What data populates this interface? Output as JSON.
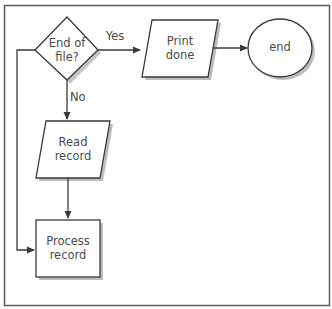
{
  "diagram": {
    "type": "flowchart",
    "nodes": [
      {
        "id": "decision",
        "shape": "diamond",
        "label": "End of\nfile?"
      },
      {
        "id": "print",
        "shape": "parallelogram",
        "label": "Print\ndone"
      },
      {
        "id": "end",
        "shape": "ellipse",
        "label": "end"
      },
      {
        "id": "read",
        "shape": "parallelogram",
        "label": "Read\nrecord"
      },
      {
        "id": "process",
        "shape": "rectangle",
        "label": "Process\nrecord"
      }
    ],
    "edges": [
      {
        "from": "decision",
        "to": "print",
        "label": "Yes"
      },
      {
        "from": "print",
        "to": "end",
        "label": ""
      },
      {
        "from": "decision",
        "to": "read",
        "label": "No"
      },
      {
        "from": "read",
        "to": "process",
        "label": ""
      },
      {
        "from": "process",
        "to": "decision",
        "label": ""
      }
    ],
    "labels": {
      "decision": "End of\nfile?",
      "print": "Print\ndone",
      "end": "end",
      "read": "Read\nrecord",
      "process": "Process\nrecord",
      "yes": "Yes",
      "no": "No"
    },
    "colors": {
      "stroke": "#3a3a3a",
      "shadow": "#b8b8b8",
      "frame": "#5a5a5a",
      "text": "#4a4a4a",
      "background": "#ffffff"
    }
  }
}
